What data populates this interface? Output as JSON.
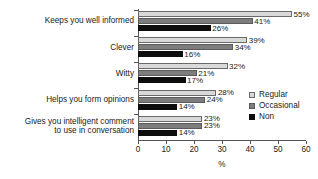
{
  "chart_data": {
    "type": "bar",
    "orientation": "horizontal",
    "title": "",
    "xlabel": "%",
    "ylabel": "",
    "xlim": [
      0,
      60
    ],
    "xticks": [
      0,
      10,
      20,
      30,
      40,
      50,
      60
    ],
    "xtick_labels": [
      "0",
      "10",
      "20",
      "30",
      "40",
      "50",
      "60"
    ],
    "grid": false,
    "legend_position": "right",
    "value_suffix": "%",
    "categories": [
      "Keeps you well informed",
      "Clever",
      "Witty",
      "Helps you form opinions",
      "Gives you intelligent comment\nto use in conversation"
    ],
    "series": [
      {
        "name": "Regular",
        "color": "#d9d9d9",
        "values": [
          55,
          39,
          32,
          28,
          23
        ]
      },
      {
        "name": "Occasional",
        "color": "#7d7d7d",
        "values": [
          41,
          34,
          21,
          24,
          23
        ]
      },
      {
        "name": "Non",
        "color": "#0d0d0d",
        "values": [
          26,
          16,
          17,
          14,
          14
        ]
      }
    ],
    "value_labels": [
      [
        "55%",
        "41%",
        "26%"
      ],
      [
        "39%",
        "34%",
        "16%"
      ],
      [
        "32%",
        "21%",
        "17%"
      ],
      [
        "28%",
        "24%",
        "14%"
      ],
      [
        "23%",
        "23%",
        "14%"
      ]
    ]
  }
}
